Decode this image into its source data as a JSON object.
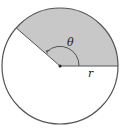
{
  "diagram": {
    "type": "circle-sector",
    "labels": {
      "angle": "θ",
      "radius": "r"
    },
    "geometry": {
      "center": [
        60,
        66
      ],
      "radius": 58,
      "sector_start_deg": 0,
      "sector_end_deg": 139
    },
    "colors": {
      "sector_fill": "#c8c8c8",
      "stroke": "#555555",
      "background": "#ffffff"
    }
  }
}
